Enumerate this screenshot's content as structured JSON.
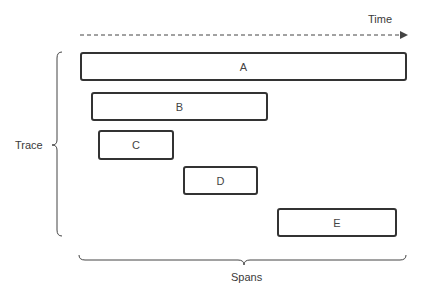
{
  "axis": {
    "time_label": "Time",
    "direction": "left-to-right"
  },
  "group_labels": {
    "trace": "Trace",
    "spans": "Spans"
  },
  "spans": [
    {
      "id": "A",
      "label": "A",
      "x": 80,
      "y": 52,
      "w": 327,
      "h": 29
    },
    {
      "id": "B",
      "label": "B",
      "x": 91,
      "y": 92,
      "w": 177,
      "h": 29
    },
    {
      "id": "C",
      "label": "C",
      "x": 98,
      "y": 130,
      "w": 76,
      "h": 30
    },
    {
      "id": "D",
      "label": "D",
      "x": 183,
      "y": 166,
      "w": 75,
      "h": 29
    },
    {
      "id": "E",
      "label": "E",
      "x": 277,
      "y": 208,
      "w": 120,
      "h": 29
    }
  ],
  "colors": {
    "stroke": "#333333",
    "text": "#3a3a3a",
    "background": "#ffffff"
  }
}
